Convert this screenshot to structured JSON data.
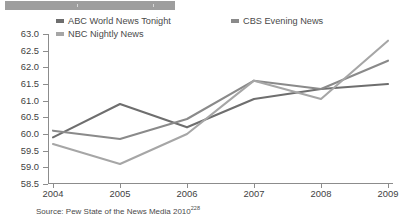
{
  "topbar": {
    "present": true,
    "color": "#9e9e9e"
  },
  "legend": {
    "items": [
      {
        "label": "ABC World News Tonight",
        "color": "#6e6e6e",
        "key": "abc"
      },
      {
        "label": "CBS Evening News",
        "color": "#8a8a8a",
        "key": "cbs"
      },
      {
        "label": "NBC Nightly News",
        "color": "#a6a6a6",
        "key": "nbc"
      }
    ]
  },
  "source": {
    "text": "Source: Pew State of the News Media 2010",
    "superscript": "228"
  },
  "chart_data": {
    "type": "line",
    "title": "",
    "xlabel": "",
    "ylabel": "",
    "categories": [
      "2004",
      "2005",
      "2006",
      "2007",
      "2008",
      "2009"
    ],
    "x": [
      2004,
      2005,
      2006,
      2007,
      2008,
      2009
    ],
    "ylim": [
      58.5,
      63.0
    ],
    "ytick_labels": [
      "63.0",
      "62.5",
      "62.0",
      "61.5",
      "61.0",
      "60.5",
      "60.0",
      "59.5",
      "59.0",
      "58.5"
    ],
    "yticks": [
      63.0,
      62.5,
      62.0,
      61.5,
      61.0,
      60.5,
      60.0,
      59.5,
      59.0,
      58.5
    ],
    "grid": false,
    "legend_position": "top",
    "series": [
      {
        "name": "ABC World News Tonight",
        "color": "#6e6e6e",
        "values": [
          59.9,
          60.9,
          60.2,
          61.05,
          61.35,
          61.5
        ]
      },
      {
        "name": "CBS Evening News",
        "color": "#8a8a8a",
        "values": [
          60.1,
          59.85,
          60.45,
          61.6,
          61.35,
          62.2
        ]
      },
      {
        "name": "NBC Nightly News",
        "color": "#a6a6a6",
        "values": [
          59.7,
          59.1,
          60.0,
          61.6,
          61.05,
          62.8
        ]
      }
    ]
  }
}
